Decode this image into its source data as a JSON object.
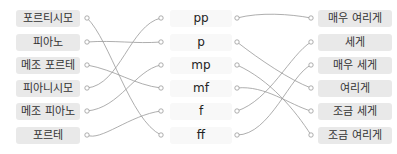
{
  "left_items": [
    {
      "label": "포르티시모"
    },
    {
      "label": "피아노"
    },
    {
      "label": "메조 포르테"
    },
    {
      "label": "피아니시모"
    },
    {
      "label": "메조 피아노"
    },
    {
      "label": "포르테"
    }
  ],
  "middle_items": [
    {
      "label": "pp"
    },
    {
      "label": "p"
    },
    {
      "label": "mp"
    },
    {
      "label": "mf"
    },
    {
      "label": "f"
    },
    {
      "label": "ff"
    }
  ],
  "right_items": [
    {
      "label": "매우 여리게"
    },
    {
      "label": "세게"
    },
    {
      "label": "매우 세게"
    },
    {
      "label": "여리게"
    },
    {
      "label": "조금 세게"
    },
    {
      "label": "조금 여리게"
    }
  ],
  "connections_left_to_middle": [
    [
      0,
      5
    ],
    [
      1,
      1
    ],
    [
      2,
      3
    ],
    [
      3,
      0
    ],
    [
      4,
      2
    ],
    [
      5,
      4
    ]
  ],
  "connections_middle_to_right": [
    [
      0,
      0
    ],
    [
      1,
      3
    ],
    [
      2,
      5
    ],
    [
      3,
      4
    ],
    [
      4,
      1
    ],
    [
      5,
      2
    ]
  ],
  "colors": {
    "box_bg": "#e9e9e9",
    "line": "#999999"
  }
}
